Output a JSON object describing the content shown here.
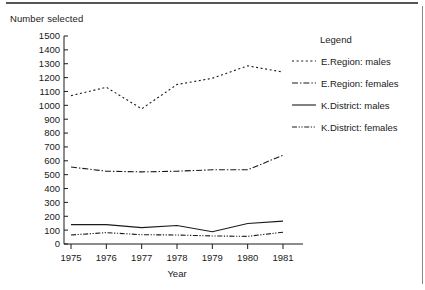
{
  "figure": {
    "y_axis_title": "Number selected",
    "x_axis_title": "Year"
  },
  "legend": {
    "title": "Legend",
    "entries": [
      {
        "label": "E.Region: males",
        "dash": "2,2.6",
        "icon": "dashed-line-icon"
      },
      {
        "label": "E.Region: females",
        "dash": "6,2,1.4,2",
        "icon": "dash-dot-line-icon"
      },
      {
        "label": "K.District: males",
        "dash": "none",
        "icon": "solid-line-icon"
      },
      {
        "label": "K.District: females",
        "dash": "5,1.6,1.2,1.6,1.2,1.6",
        "icon": "dash-dot-dot-line-icon"
      }
    ]
  },
  "chart_data": {
    "type": "line",
    "title": "",
    "xlabel": "Year",
    "ylabel": "Number selected",
    "x": [
      1975,
      1976,
      1977,
      1978,
      1979,
      1980,
      1981
    ],
    "xtick_labels": [
      "1975",
      "1976",
      "1977",
      "1978",
      "1979",
      "1980",
      "1981"
    ],
    "ytick_labels": [
      "0",
      "100",
      "200",
      "300",
      "400",
      "500",
      "600",
      "700",
      "800",
      "900",
      "1000",
      "1100",
      "1200",
      "1300",
      "1400",
      "1500"
    ],
    "ylim": [
      0,
      1500
    ],
    "ytick_step": 100,
    "grid": false,
    "legend_position": "right",
    "series": [
      {
        "name": "E.Region: males",
        "linestyle": "dashed",
        "values": [
          1070,
          1130,
          975,
          1150,
          1195,
          1285,
          1240
        ]
      },
      {
        "name": "E.Region: females",
        "linestyle": "dashdot",
        "values": [
          555,
          525,
          520,
          525,
          535,
          535,
          640
        ]
      },
      {
        "name": "K.District: males",
        "linestyle": "solid",
        "values": [
          140,
          140,
          118,
          133,
          88,
          148,
          165
        ]
      },
      {
        "name": "K.District: females",
        "linestyle": "dashdotdot",
        "values": [
          65,
          82,
          67,
          65,
          58,
          55,
          85
        ]
      }
    ]
  }
}
